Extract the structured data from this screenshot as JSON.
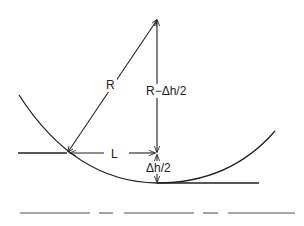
{
  "diagram": {
    "type": "geometry",
    "labels": {
      "radius": "R",
      "vertical": "R−Δh/2",
      "half_length": "L",
      "sag": "Δh/2"
    },
    "colors": {
      "stroke": "#222222",
      "background": "#ffffff"
    }
  }
}
